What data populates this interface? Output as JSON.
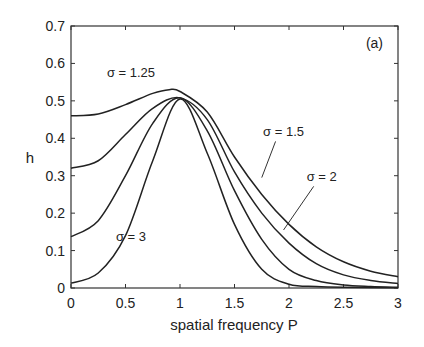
{
  "chart_data": {
    "type": "line",
    "title": "",
    "panel_label": "(a)",
    "xlabel": "spatial frequency P",
    "ylabel": "h",
    "xlim": [
      0,
      3
    ],
    "ylim": [
      0,
      0.7
    ],
    "xticks": [
      0,
      0.5,
      1,
      1.5,
      2,
      2.5,
      3
    ],
    "xtick_labels": [
      "0",
      "0.5",
      "1",
      "1.5",
      "2",
      "2.5",
      "3"
    ],
    "yticks": [
      0,
      0.1,
      0.2,
      0.3,
      0.4,
      0.5,
      0.6,
      0.7
    ],
    "ytick_labels": [
      "0",
      "0.1",
      "0.2",
      "0.3",
      "0.4",
      "0.5",
      "0.6",
      "0.7"
    ],
    "grid": false,
    "legend": "inline annotations",
    "series": [
      {
        "name": "σ = 1.25",
        "x": [
          0,
          0.25,
          0.5,
          0.75,
          0.9,
          1.0,
          1.25,
          1.5,
          1.75,
          2.0,
          2.25,
          2.5,
          2.75,
          3.0
        ],
        "y": [
          0.46,
          0.465,
          0.49,
          0.52,
          0.53,
          0.525,
          0.47,
          0.35,
          0.25,
          0.17,
          0.11,
          0.07,
          0.045,
          0.03
        ]
      },
      {
        "name": "σ = 1.5",
        "x": [
          0,
          0.25,
          0.5,
          0.75,
          1.0,
          1.25,
          1.5,
          1.75,
          2.0,
          2.25,
          2.5,
          2.75,
          3.0
        ],
        "y": [
          0.32,
          0.34,
          0.41,
          0.48,
          0.508,
          0.45,
          0.31,
          0.2,
          0.12,
          0.065,
          0.035,
          0.02,
          0.012
        ]
      },
      {
        "name": "σ = 2",
        "x": [
          0,
          0.25,
          0.5,
          0.75,
          1.0,
          1.25,
          1.5,
          1.75,
          2.0,
          2.25,
          2.5,
          2.75,
          3.0
        ],
        "y": [
          0.137,
          0.18,
          0.3,
          0.44,
          0.508,
          0.42,
          0.26,
          0.13,
          0.05,
          0.02,
          0.008,
          0.004,
          0.002
        ]
      },
      {
        "name": "σ = 3",
        "x": [
          0,
          0.25,
          0.5,
          0.75,
          1.0,
          1.25,
          1.5,
          1.75,
          2.0,
          2.25,
          2.5,
          3.0
        ],
        "y": [
          0.013,
          0.04,
          0.14,
          0.34,
          0.505,
          0.36,
          0.17,
          0.05,
          0.01,
          0.004,
          0.002,
          0.001
        ]
      }
    ],
    "annotations": [
      {
        "text": "σ = 1.25",
        "x": 0.55,
        "y": 0.565
      },
      {
        "text": "σ = 1.5",
        "x": 1.95,
        "y": 0.405,
        "leader_to": [
          1.75,
          0.295
        ]
      },
      {
        "text": "σ = 2",
        "x": 2.3,
        "y": 0.285,
        "leader_to": [
          1.95,
          0.155
        ]
      },
      {
        "text": "σ = 3",
        "x": 0.55,
        "y": 0.125
      }
    ]
  },
  "colors": {
    "line": "#222222",
    "axis": "#333333",
    "background": "#ffffff"
  }
}
